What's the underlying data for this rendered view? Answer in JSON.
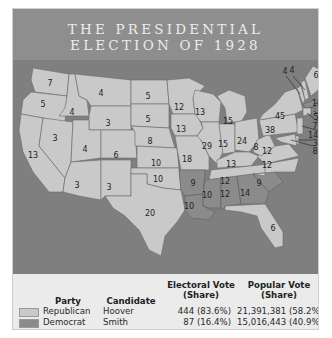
{
  "title": {
    "line1": "THE PRESIDENTIAL",
    "line2": "ELECTION OF 1928"
  },
  "colors": {
    "republican": "#c9c9c9",
    "democrat": "#8b8b8b",
    "background": "#7f7f7f",
    "title_bar": "#8e8e8e",
    "legend_bg": "#ebebeb"
  },
  "map": {
    "states": [
      {
        "abbr": "WA",
        "ev": "7",
        "party": "Republican"
      },
      {
        "abbr": "OR",
        "ev": "5",
        "party": "Republican"
      },
      {
        "abbr": "CA",
        "ev": "13",
        "party": "Republican"
      },
      {
        "abbr": "ID",
        "ev": "4",
        "party": "Republican"
      },
      {
        "abbr": "NV",
        "ev": "3",
        "party": "Republican"
      },
      {
        "abbr": "MT",
        "ev": "4",
        "party": "Republican"
      },
      {
        "abbr": "WY",
        "ev": "3",
        "party": "Republican"
      },
      {
        "abbr": "UT",
        "ev": "4",
        "party": "Republican"
      },
      {
        "abbr": "CO",
        "ev": "6",
        "party": "Republican"
      },
      {
        "abbr": "AZ",
        "ev": "3",
        "party": "Republican"
      },
      {
        "abbr": "NM",
        "ev": "3",
        "party": "Republican"
      },
      {
        "abbr": "ND",
        "ev": "5",
        "party": "Republican"
      },
      {
        "abbr": "SD",
        "ev": "5",
        "party": "Republican"
      },
      {
        "abbr": "NE",
        "ev": "8",
        "party": "Republican"
      },
      {
        "abbr": "KS",
        "ev": "10",
        "party": "Republican"
      },
      {
        "abbr": "OK",
        "ev": "10",
        "party": "Republican"
      },
      {
        "abbr": "TX",
        "ev": "20",
        "party": "Republican"
      },
      {
        "abbr": "MN",
        "ev": "12",
        "party": "Republican"
      },
      {
        "abbr": "IA",
        "ev": "13",
        "party": "Republican"
      },
      {
        "abbr": "MO",
        "ev": "18",
        "party": "Republican"
      },
      {
        "abbr": "AR",
        "ev": "9",
        "party": "Democrat"
      },
      {
        "abbr": "LA",
        "ev": "10",
        "party": "Democrat"
      },
      {
        "abbr": "WI",
        "ev": "13",
        "party": "Republican"
      },
      {
        "abbr": "IL",
        "ev": "29",
        "party": "Republican"
      },
      {
        "abbr": "MI",
        "ev": "15",
        "party": "Republican"
      },
      {
        "abbr": "IN",
        "ev": "15",
        "party": "Republican"
      },
      {
        "abbr": "OH",
        "ev": "24",
        "party": "Republican"
      },
      {
        "abbr": "KY",
        "ev": "13",
        "party": "Republican"
      },
      {
        "abbr": "TN",
        "ev": "12",
        "party": "Republican"
      },
      {
        "abbr": "MS",
        "ev": "10",
        "party": "Democrat"
      },
      {
        "abbr": "AL",
        "ev": "12",
        "party": "Democrat"
      },
      {
        "abbr": "GA",
        "ev": "14",
        "party": "Democrat"
      },
      {
        "abbr": "FL",
        "ev": "6",
        "party": "Republican"
      },
      {
        "abbr": "SC",
        "ev": "9",
        "party": "Democrat"
      },
      {
        "abbr": "NC",
        "ev": "12",
        "party": "Republican"
      },
      {
        "abbr": "VA",
        "ev": "12",
        "party": "Republican"
      },
      {
        "abbr": "WV",
        "ev": "8",
        "party": "Republican"
      },
      {
        "abbr": "PA",
        "ev": "38",
        "party": "Republican"
      },
      {
        "abbr": "NY",
        "ev": "45",
        "party": "Republican"
      },
      {
        "abbr": "VT",
        "ev": "4",
        "party": "Republican"
      },
      {
        "abbr": "NH",
        "ev": "4",
        "party": "Republican"
      },
      {
        "abbr": "ME",
        "ev": "6",
        "party": "Republican"
      },
      {
        "abbr": "MA",
        "ev": "18",
        "party": "Democrat"
      },
      {
        "abbr": "RI",
        "ev": "5",
        "party": "Democrat"
      },
      {
        "abbr": "CT",
        "ev": "7",
        "party": "Republican"
      },
      {
        "abbr": "NJ",
        "ev": "14",
        "party": "Republican"
      },
      {
        "abbr": "DE",
        "ev": "3",
        "party": "Republican"
      },
      {
        "abbr": "MD",
        "ev": "8",
        "party": "Republican"
      }
    ]
  },
  "legend": {
    "headers": {
      "party": "Party",
      "candidate": "Candidate",
      "electoral_1": "Electoral Vote",
      "electoral_2": "(Share)",
      "popular_1": "Popular Vote",
      "popular_2": "(Share)"
    },
    "rows": [
      {
        "party": "Republican",
        "candidate": "Hoover",
        "electoral": "444 (83.6%)",
        "popular": "21,391,381 (58.2%)"
      },
      {
        "party": "Democrat",
        "candidate": "Smith",
        "electoral": "87 (16.4%)",
        "popular": "15,016,443 (40.9%)"
      }
    ]
  }
}
